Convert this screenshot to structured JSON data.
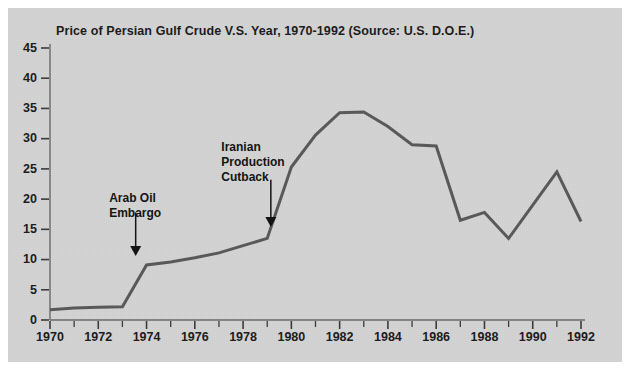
{
  "chart_data": {
    "type": "line",
    "title": "Price of Persian Gulf Crude V.S. Year, 1970-1992 (Source: U.S. D.O.E.)",
    "xlabel": "",
    "ylabel": "",
    "xlim": [
      1970,
      1992
    ],
    "ylim": [
      0,
      45
    ],
    "grid": false,
    "legend": "none",
    "x": [
      1970,
      1971,
      1972,
      1973,
      1974,
      1975,
      1976,
      1977,
      1978,
      1979,
      1980,
      1981,
      1982,
      1983,
      1984,
      1985,
      1986,
      1987,
      1988,
      1989,
      1990,
      1991,
      1992
    ],
    "values": [
      1.7,
      2.0,
      2.1,
      2.2,
      9.1,
      9.6,
      10.3,
      11.1,
      12.3,
      13.5,
      25.3,
      30.6,
      34.3,
      34.4,
      32.0,
      29.0,
      28.8,
      16.5,
      17.8,
      13.5,
      19.0,
      24.5,
      16.3
    ],
    "series": [
      {
        "name": "Price of Persian Gulf Crude",
        "color": "#585858",
        "values": [
          1.7,
          2.0,
          2.1,
          2.2,
          9.1,
          9.6,
          10.3,
          11.1,
          12.3,
          13.5,
          25.3,
          30.6,
          34.3,
          34.4,
          32.0,
          29.0,
          28.8,
          16.5,
          17.8,
          13.5,
          19.0,
          24.5,
          16.3
        ]
      }
    ],
    "ytick_labels": [
      "0",
      "5",
      "10",
      "15",
      "20",
      "25",
      "30",
      "35",
      "40",
      "45"
    ],
    "ytick_values": [
      0,
      5,
      10,
      15,
      20,
      25,
      30,
      35,
      40,
      45
    ],
    "xtick_labels": [
      "1970",
      "1972",
      "1974",
      "1976",
      "1978",
      "1980",
      "1982",
      "1984",
      "1986",
      "1988",
      "1990",
      "1992"
    ],
    "xtick_values": [
      1970,
      1972,
      1974,
      1976,
      1978,
      1980,
      1982,
      1984,
      1986,
      1988,
      1990,
      1992
    ],
    "xtick_minor_values": [
      1971,
      1973,
      1975,
      1977,
      1979,
      1981,
      1983,
      1985,
      1987,
      1989,
      1991
    ],
    "annotations": [
      {
        "id": "arab-oil-embargo",
        "lines": [
          "Arab Oil",
          "Embargo"
        ],
        "text_x": 1972.45,
        "text_y": 21.0,
        "arrow_x": 1973.55,
        "arrow_from_y": 17.8,
        "arrow_to_y": 10.6
      },
      {
        "id": "iranian-production-cutback",
        "lines": [
          "Iranian",
          "Production",
          "Cutback"
        ],
        "text_x": 1977.1,
        "text_y": 29.5,
        "arrow_x": 1979.15,
        "arrow_from_y": 23.2,
        "arrow_to_y": 15.4
      }
    ],
    "colors": {
      "panel_background": "#d3d3d3",
      "figure_background": "#ffffff",
      "line": "#585858",
      "axis": "#6a6a6a",
      "text": "#1a1a1a"
    }
  }
}
